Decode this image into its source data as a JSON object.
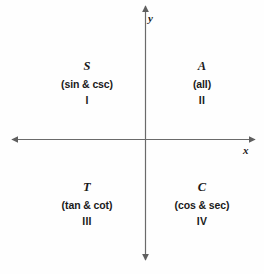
{
  "diagram": {
    "background_color": "#fefefe",
    "axis_color": "#6a6a6a",
    "text_color": "#1a1a1a",
    "axes": {
      "x_label": "x",
      "y_label": "y",
      "origin": {
        "x": 145,
        "y": 139
      },
      "x_extent": [
        10,
        257
      ],
      "y_extent": [
        4,
        262
      ],
      "arrowheads": [
        "left",
        "right",
        "up",
        "down"
      ]
    },
    "quadrants": [
      {
        "position": "upper-left",
        "letter": "S",
        "functions": "(sin & csc)",
        "numeral": "I"
      },
      {
        "position": "upper-right",
        "letter": "A",
        "functions": "(all)",
        "numeral": "II"
      },
      {
        "position": "lower-left",
        "letter": "T",
        "functions": "(tan & cot)",
        "numeral": "III"
      },
      {
        "position": "lower-right",
        "letter": "C",
        "functions": "(cos & sec)",
        "numeral": "IV"
      }
    ]
  }
}
